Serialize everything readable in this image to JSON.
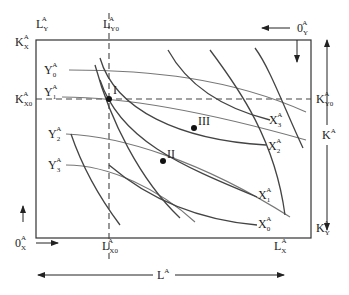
{
  "diagram": {
    "type": "edgeworth-box-production",
    "superscript": "A",
    "top_labels": {
      "L_Y": {
        "base": "L",
        "sub": "Y"
      },
      "L_Y0": {
        "base": "L",
        "sub": "Y0"
      },
      "origin_Y": {
        "base": "0",
        "sub": "Y"
      }
    },
    "left_labels": {
      "K_X": {
        "base": "K",
        "sub": "X"
      },
      "K_X0": {
        "base": "K",
        "sub": "X0"
      },
      "origin_X": {
        "base": "0",
        "sub": "X"
      }
    },
    "right_labels": {
      "K_Y0": {
        "base": "K",
        "sub": "Y0"
      },
      "K_Y": {
        "base": "K",
        "sub": "Y"
      },
      "K_total": {
        "base": "K",
        "sub": ""
      }
    },
    "bottom_labels": {
      "L_X0": {
        "base": "L",
        "sub": "X0"
      },
      "L_X": {
        "base": "L",
        "sub": "X"
      },
      "L_total": {
        "base": "L",
        "sub": ""
      }
    },
    "y_isoquants": [
      {
        "base": "Y",
        "sub": "0"
      },
      {
        "base": "Y",
        "sub": "1"
      },
      {
        "base": "Y",
        "sub": "2"
      },
      {
        "base": "Y",
        "sub": "3"
      }
    ],
    "x_isoquants": [
      {
        "base": "X",
        "sub": "3"
      },
      {
        "base": "X",
        "sub": "2"
      },
      {
        "base": "X",
        "sub": "1"
      },
      {
        "base": "X",
        "sub": "0"
      }
    ],
    "points": [
      {
        "label": "I"
      },
      {
        "label": "II"
      },
      {
        "label": "III"
      }
    ]
  }
}
